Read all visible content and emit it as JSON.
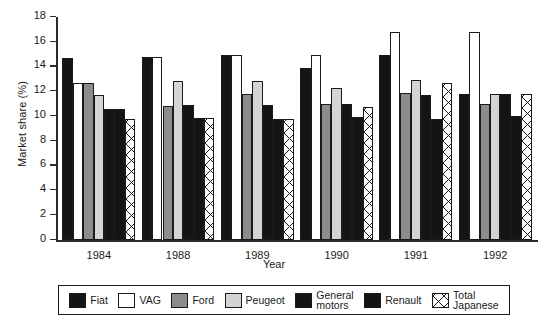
{
  "chart_data": {
    "type": "bar",
    "title": "",
    "xlabel": "Year",
    "ylabel": "Market share (%)",
    "categories": [
      "1984",
      "1988",
      "1989",
      "1990",
      "1991",
      "1992"
    ],
    "ylim": [
      0,
      18
    ],
    "yticks": [
      0,
      2,
      4,
      6,
      8,
      10,
      12,
      14,
      16,
      18
    ],
    "grid": false,
    "legend_position": "below-axes",
    "series": [
      {
        "name": "Fiat",
        "color": "#141414",
        "values": [
          14.7,
          14.8,
          14.9,
          13.85,
          14.9,
          11.8
        ]
      },
      {
        "name": "VAG",
        "color": "#ffffff",
        "values": [
          12.7,
          14.8,
          14.9,
          14.9,
          16.8,
          16.8
        ]
      },
      {
        "name": "Ford",
        "color": "#8c8c8c",
        "values": [
          12.7,
          10.8,
          11.8,
          11.0,
          11.9,
          11.0
        ]
      },
      {
        "name": "Peugeot",
        "color": "#d4d4d4",
        "values": [
          11.7,
          12.8,
          12.8,
          12.3,
          12.9,
          11.8
        ]
      },
      {
        "name": "General motors",
        "color": "#141414",
        "values": [
          10.6,
          10.9,
          10.9,
          11.0,
          11.7,
          11.8
        ]
      },
      {
        "name": "Renault",
        "color": "#141414",
        "values": [
          10.6,
          9.85,
          9.8,
          9.9,
          9.8,
          10.0
        ]
      },
      {
        "name": "Total Japanese",
        "color": "#ffffff",
        "values": [
          9.75,
          9.85,
          9.8,
          10.7,
          12.7,
          11.8
        ]
      }
    ]
  },
  "axes": {
    "ylabel": "Market share (%)",
    "xlabel": "Year",
    "ytick_labels": [
      "0",
      "2",
      "4",
      "6",
      "8",
      "10",
      "12",
      "14",
      "16",
      "18"
    ],
    "xtick_labels": [
      "1984",
      "1988",
      "1989",
      "1990",
      "1991",
      "1992"
    ]
  },
  "legend": {
    "items": [
      {
        "label": "Fiat",
        "swatch": "fiat"
      },
      {
        "label": "VAG",
        "swatch": "vag"
      },
      {
        "label": "Ford",
        "swatch": "ford"
      },
      {
        "label": "Peugeot",
        "swatch": "peugeot"
      },
      {
        "label": "General\nmotors",
        "swatch": "gm"
      },
      {
        "label": "Renault",
        "swatch": "renault"
      },
      {
        "label": "Total\nJapanese",
        "swatch": "japanese"
      }
    ]
  }
}
